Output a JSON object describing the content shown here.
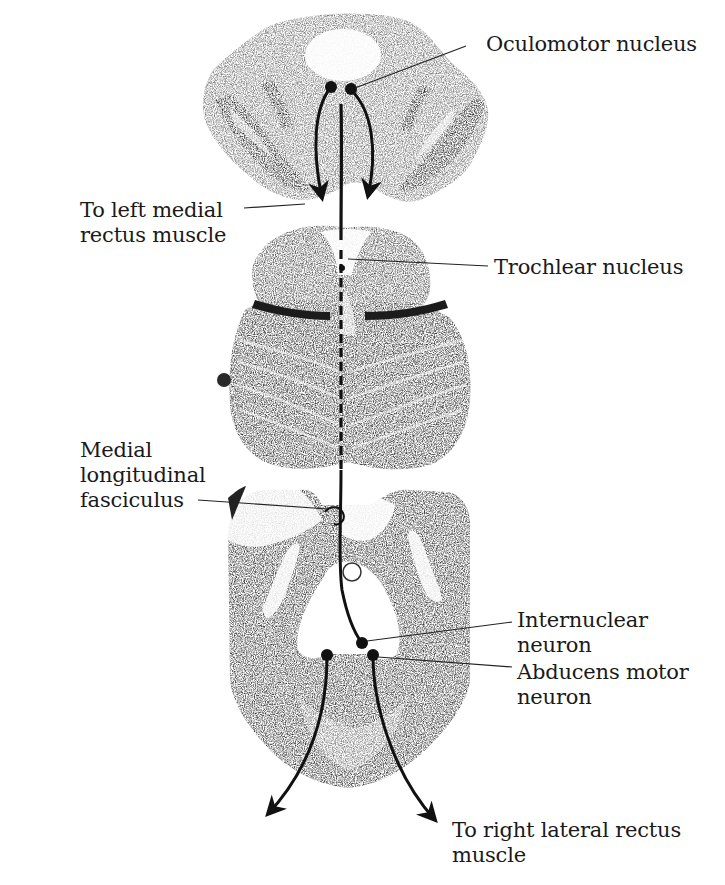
{
  "diagram": {
    "type": "neuroanatomy-pathway",
    "sections": [
      {
        "id": "midbrain-superior",
        "name": "Midbrain (oculomotor level)"
      },
      {
        "id": "midbrain-inferior-pons",
        "name": "Caudal midbrain / pons (trochlear level)"
      },
      {
        "id": "pons-abducens",
        "name": "Pons (abducens level)"
      }
    ],
    "labels": {
      "oculomotor": "Oculomotor nucleus",
      "left_medial_rectus": [
        "To left medial",
        "rectus muscle"
      ],
      "trochlear": "Trochlear nucleus",
      "mlf": [
        "Medial",
        "longitudinal",
        "fasciculus"
      ],
      "internuclear": [
        "Internuclear",
        "neuron"
      ],
      "abducens": [
        "Abducens motor",
        "neuron"
      ],
      "right_lateral_rectus": [
        "To right lateral rectus",
        "muscle"
      ]
    },
    "colors": {
      "ink": "#111111",
      "tissue_dark": "#3a3a3a",
      "tissue_mid": "#6e6e6e",
      "tissue_light": "#a8a8a8",
      "background": "#ffffff"
    }
  }
}
